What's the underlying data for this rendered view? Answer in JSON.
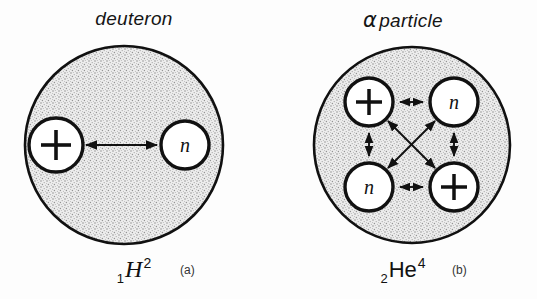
{
  "figure": {
    "background_color": "#fdfdfd",
    "ink_color": "#111111",
    "stipple_fill_color": "#e8e8e8"
  },
  "panels": [
    {
      "id": "deuteron",
      "title": "deuteron",
      "title_prefix_symbol": "",
      "nuclide": {
        "subscript": "1",
        "element": "H",
        "superscript": "2"
      },
      "subfigure_tag": "(a)",
      "nucleus": {
        "radius": 101,
        "center_x": 102,
        "center_y": 103
      },
      "nucleons": [
        {
          "kind": "proton",
          "label": "+",
          "x": 34,
          "y": 103,
          "r": 28
        },
        {
          "kind": "neutron",
          "label": "n",
          "x": 163,
          "y": 103,
          "r": 25
        }
      ],
      "bonds": [
        {
          "from": 0,
          "to": 1,
          "style": "double-headed"
        }
      ]
    },
    {
      "id": "alpha",
      "title": "particle",
      "title_prefix_symbol": "α",
      "nuclide": {
        "subscript": "2",
        "element": "He",
        "superscript": "4"
      },
      "subfigure_tag": "(b)",
      "nucleus": {
        "radius": 100,
        "center_x": 100,
        "center_y": 100
      },
      "nucleons": [
        {
          "kind": "proton",
          "label": "+",
          "x": 57,
          "y": 57,
          "r": 25
        },
        {
          "kind": "neutron",
          "label": "n",
          "x": 142,
          "y": 57,
          "r": 25
        },
        {
          "kind": "neutron",
          "label": "n",
          "x": 57,
          "y": 142,
          "r": 25
        },
        {
          "kind": "proton",
          "label": "+",
          "x": 142,
          "y": 142,
          "r": 25
        }
      ],
      "bonds": [
        {
          "from": 0,
          "to": 1,
          "style": "double-headed"
        },
        {
          "from": 2,
          "to": 3,
          "style": "double-headed"
        },
        {
          "from": 0,
          "to": 2,
          "style": "double-headed"
        },
        {
          "from": 1,
          "to": 3,
          "style": "double-headed"
        },
        {
          "from": 0,
          "to": 3,
          "style": "double-headed"
        },
        {
          "from": 1,
          "to": 2,
          "style": "double-headed"
        }
      ]
    }
  ]
}
